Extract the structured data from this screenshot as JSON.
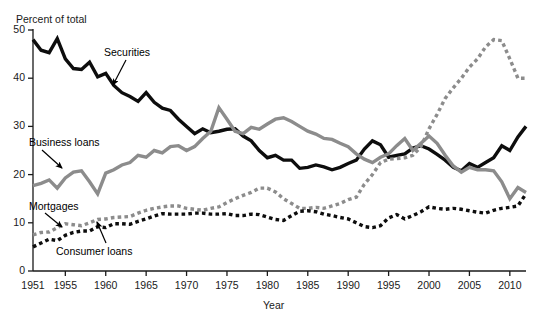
{
  "figure": {
    "background": "#ffffff",
    "top_clipped_text": "",
    "ylabel": "Percent of total",
    "xlabel": "Year"
  },
  "annotations": [
    {
      "name": "securities",
      "label": "Securities",
      "x": 104,
      "y": 46,
      "arrow": {
        "x1": 126,
        "y1": 60,
        "x2": 113,
        "y2": 85
      }
    },
    {
      "name": "business-loans",
      "label": "Business loans",
      "x": 29,
      "y": 136,
      "arrow": {
        "x1": 42,
        "y1": 150,
        "x2": 62,
        "y2": 168
      }
    },
    {
      "name": "mortgages",
      "label": "Mortgages",
      "x": 29,
      "y": 200,
      "arrow": {
        "x1": 45,
        "y1": 213,
        "x2": 62,
        "y2": 227
      }
    },
    {
      "name": "consumer-loans",
      "label": "Consumer loans",
      "x": 56,
      "y": 245,
      "arrow": {
        "x1": 106,
        "y1": 243,
        "x2": 97,
        "y2": 222
      }
    }
  ],
  "chart_data": {
    "type": "line",
    "title": "",
    "xlabel": "Year",
    "ylabel": "Percent of total",
    "xlim": [
      1951,
      2012
    ],
    "ylim": [
      0,
      50
    ],
    "yticks": [
      0,
      10,
      20,
      30,
      40,
      50
    ],
    "xticks": [
      1951,
      1955,
      1960,
      1965,
      1970,
      1975,
      1980,
      1985,
      1990,
      1995,
      2000,
      2005,
      2010
    ],
    "xtick_labels": [
      "1951",
      "1955",
      "1960",
      "1965",
      "1970",
      "1975",
      "1980",
      "1985",
      "1990",
      "1995",
      "2000",
      "2005",
      "2010"
    ],
    "ytick_labels": [
      "0",
      "10",
      "20",
      "30",
      "40",
      "50"
    ],
    "grid": false,
    "legend_position": "inline-annotations",
    "x": [
      1951,
      1952,
      1953,
      1954,
      1955,
      1956,
      1957,
      1958,
      1959,
      1960,
      1961,
      1962,
      1963,
      1964,
      1965,
      1966,
      1967,
      1968,
      1969,
      1970,
      1971,
      1972,
      1973,
      1974,
      1975,
      1976,
      1977,
      1978,
      1979,
      1980,
      1981,
      1982,
      1983,
      1984,
      1985,
      1986,
      1987,
      1988,
      1989,
      1990,
      1991,
      1992,
      1993,
      1994,
      1995,
      1996,
      1997,
      1998,
      1999,
      2000,
      2001,
      2002,
      2003,
      2004,
      2005,
      2006,
      2007,
      2008,
      2009,
      2010,
      2011,
      2012
    ],
    "series": [
      {
        "name": "Securities",
        "color": "#0d0d0d",
        "style": "solid",
        "width": 3.4,
        "values": [
          48.0,
          45.8,
          45.3,
          48.2,
          44.0,
          42.0,
          41.8,
          43.3,
          40.3,
          41.0,
          38.5,
          37.0,
          36.2,
          35.2,
          37.0,
          35.0,
          33.8,
          33.3,
          31.5,
          30.0,
          28.5,
          29.5,
          28.7,
          29.0,
          29.4,
          29.5,
          28.0,
          27.0,
          25.0,
          23.5,
          24.0,
          23.0,
          23.0,
          21.3,
          21.5,
          22.0,
          21.6,
          21.0,
          21.5,
          22.3,
          23.0,
          25.3,
          27.0,
          26.2,
          23.6,
          24.0,
          24.3,
          25.5,
          26.0,
          25.3,
          24.2,
          23.0,
          21.5,
          20.8,
          22.3,
          21.5,
          22.5,
          23.5,
          26.0,
          25.0,
          27.8,
          30.0
        ]
      },
      {
        "name": "Business loans",
        "color": "#8c8c8c",
        "style": "solid",
        "width": 3.4,
        "values": [
          17.7,
          18.2,
          18.9,
          17.2,
          19.3,
          20.5,
          20.8,
          18.5,
          16.0,
          20.3,
          21.0,
          22.0,
          22.5,
          24.0,
          23.6,
          25.0,
          24.5,
          25.8,
          26.0,
          25.0,
          25.8,
          27.5,
          29.0,
          33.9,
          31.5,
          29.0,
          28.5,
          29.8,
          29.4,
          30.5,
          31.5,
          31.8,
          31.0,
          30.0,
          29.0,
          28.4,
          27.5,
          27.3,
          26.5,
          25.8,
          24.3,
          23.2,
          22.5,
          23.6,
          24.3,
          26.0,
          27.5,
          25.0,
          26.5,
          28.0,
          26.5,
          24.0,
          21.8,
          20.5,
          21.5,
          21.0,
          21.0,
          20.8,
          18.5,
          15.0,
          17.3,
          16.3
        ]
      },
      {
        "name": "Mortgages",
        "color": "#8c8c8c",
        "style": "dashed",
        "width": 3.4,
        "values": [
          7.5,
          8.0,
          8.1,
          9.0,
          9.8,
          9.6,
          9.4,
          10.0,
          10.7,
          10.8,
          11.1,
          11.2,
          11.3,
          12.0,
          12.6,
          13.0,
          13.3,
          13.5,
          13.5,
          13.0,
          12.8,
          12.6,
          13.0,
          13.3,
          14.2,
          15.0,
          15.7,
          16.3,
          17.2,
          17.2,
          16.4,
          15.0,
          14.0,
          13.0,
          13.0,
          13.2,
          13.0,
          13.5,
          14.0,
          14.8,
          15.3,
          18.0,
          20.0,
          22.5,
          23.2,
          23.3,
          23.5,
          24.0,
          25.8,
          29.5,
          32.5,
          35.8,
          38.0,
          40.0,
          42.3,
          44.0,
          46.5,
          48.0,
          47.8,
          44.0,
          40.0,
          40.0
        ]
      },
      {
        "name": "Consumer loans",
        "color": "#0d0d0d",
        "style": "dashed",
        "width": 3.4,
        "values": [
          5.0,
          5.8,
          6.6,
          6.3,
          7.4,
          8.0,
          8.3,
          8.3,
          9.2,
          9.0,
          9.8,
          9.8,
          9.7,
          10.3,
          10.8,
          11.4,
          11.9,
          11.8,
          11.8,
          11.8,
          12.0,
          12.0,
          11.8,
          11.8,
          11.9,
          11.5,
          11.5,
          11.8,
          11.7,
          11.2,
          10.7,
          10.5,
          11.5,
          12.4,
          12.5,
          12.3,
          11.8,
          11.5,
          11.1,
          10.8,
          10.0,
          9.2,
          9.0,
          9.4,
          11.0,
          11.7,
          10.8,
          11.5,
          12.3,
          13.3,
          13.0,
          12.8,
          13.0,
          12.8,
          12.5,
          12.2,
          12.0,
          12.6,
          13.0,
          13.2,
          13.5,
          16.0
        ]
      }
    ]
  },
  "axes_geometry": {
    "left": 33,
    "right": 526,
    "top": 30,
    "bottom": 271,
    "x_min_year": 1951,
    "x_max_year": 2012
  }
}
